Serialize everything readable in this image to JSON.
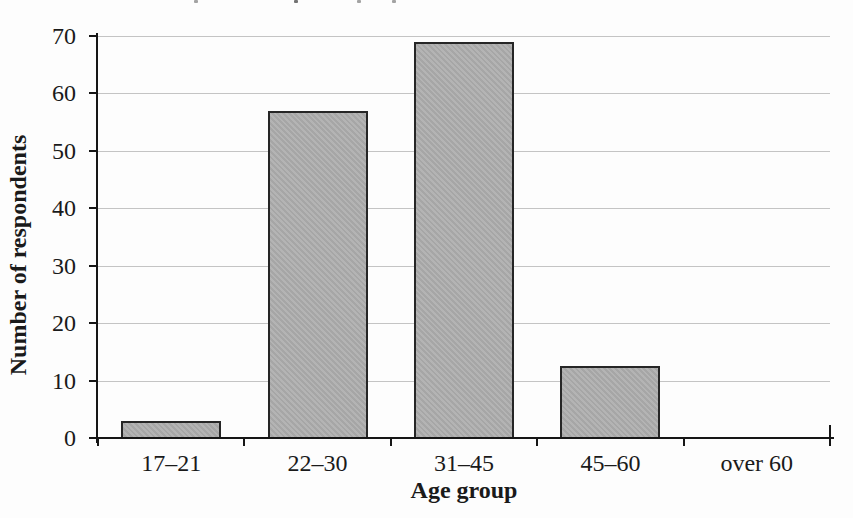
{
  "chart_data": {
    "type": "bar",
    "categories": [
      "17–21",
      "22–30",
      "31–45",
      "45–60",
      "over 60"
    ],
    "values": [
      3,
      57,
      69,
      12.5,
      0
    ],
    "title": "",
    "xlabel": "Age group",
    "ylabel": "Number of respondents",
    "ylim": [
      0,
      70
    ],
    "ytick_step": 10,
    "yticks": [
      0,
      10,
      20,
      30,
      40,
      50,
      60,
      70
    ],
    "grid": true,
    "legend": "none",
    "colors": {
      "bar_fill": "#afafaf",
      "bar_border": "#262626",
      "gridline": "#c4c4c4",
      "axis": "#161616",
      "text": "#1a1a1a",
      "background": "#fdfdfd"
    }
  }
}
